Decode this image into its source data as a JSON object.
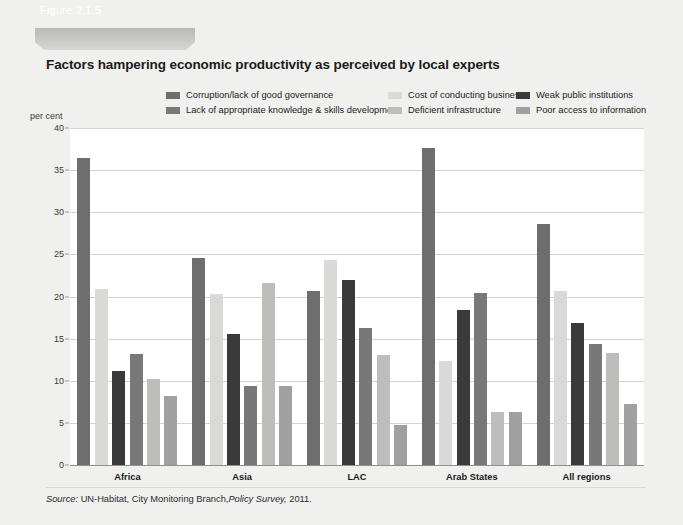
{
  "figure": {
    "tag": "Figure 2.1.5",
    "title": "Factors hampering economic productivity as perceived by local experts",
    "source_prefix": "Source:",
    "source_body": " UN-Habitat, City Monitoring Branch,",
    "source_italic": "Policy Survey,",
    "source_year": " 2011."
  },
  "colors": {
    "page_background": "#f0f0ee",
    "plot_background": "#ffffff",
    "gridline": "#d3d3d1",
    "axis": "#8f8f8d",
    "series": [
      "#6e6e6e",
      "#d9d9d7",
      "#3a3a3a",
      "#787878",
      "#bdbdbb",
      "#a0a0a0"
    ],
    "banner": "#c6c6c4",
    "text": "#1b1b1b"
  },
  "chart_data": {
    "type": "bar",
    "title": "Factors hampering economic productivity as perceived by local experts",
    "xlabel": "",
    "ylabel": "per cent",
    "ylim": [
      0,
      40
    ],
    "ytick_step": 5,
    "yticks": [
      0,
      5,
      10,
      15,
      20,
      25,
      30,
      35,
      40
    ],
    "grid": true,
    "legend_position": "top",
    "categories": [
      "Africa",
      "Asia",
      "LAC",
      "Arab States",
      "All regions"
    ],
    "series": [
      {
        "name": "Corruption/lack of good governance",
        "color": "#6e6e6e",
        "values": [
          36.5,
          24.6,
          20.6,
          37.6,
          28.6
        ]
      },
      {
        "name": "Cost of conducting business",
        "color": "#d9d9d7",
        "values": [
          20.9,
          20.3,
          24.3,
          12.3,
          20.6
        ]
      },
      {
        "name": "Weak public institutions",
        "color": "#3a3a3a",
        "values": [
          11.2,
          15.5,
          22.0,
          18.4,
          16.8
        ]
      },
      {
        "name": "Lack of appropriate knowledge & skills development",
        "color": "#787878",
        "values": [
          13.2,
          9.4,
          16.3,
          20.4,
          14.4
        ]
      },
      {
        "name": "Deficient infrastructure",
        "color": "#bdbdbb",
        "values": [
          10.2,
          21.6,
          13.1,
          6.3,
          13.3
        ]
      },
      {
        "name": "Poor access to information",
        "color": "#a0a0a0",
        "values": [
          8.2,
          9.4,
          4.8,
          6.3,
          7.2
        ]
      }
    ]
  },
  "legend_layout": [
    {
      "series_index": 0,
      "left": 0,
      "top": 0
    },
    {
      "series_index": 3,
      "left": 0,
      "top": 15
    },
    {
      "series_index": 1,
      "left": 222,
      "top": 0
    },
    {
      "series_index": 4,
      "left": 222,
      "top": 15
    },
    {
      "series_index": 2,
      "left": 350,
      "top": 0
    },
    {
      "series_index": 5,
      "left": 350,
      "top": 15
    }
  ]
}
